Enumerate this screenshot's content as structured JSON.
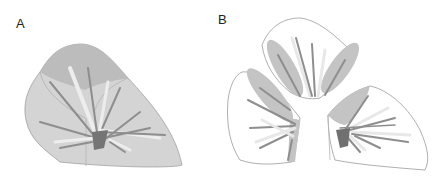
{
  "figure": {
    "panels": [
      {
        "label": "A",
        "description": "intact lung lobe with bronchial tree"
      },
      {
        "label": "B",
        "description": "lobe separated into three segments"
      }
    ],
    "colors": {
      "lobe_fill_dark": "#b9b9b9",
      "lobe_fill_light": "#d6d6d6",
      "segment_fill": "#ffffff",
      "cut_face": "#c4c4c4",
      "outline": "#9a9a9a",
      "branch_dark": "#8c8c8c",
      "branch_light": "#ececec",
      "hilum": "#6f6f6f"
    }
  }
}
